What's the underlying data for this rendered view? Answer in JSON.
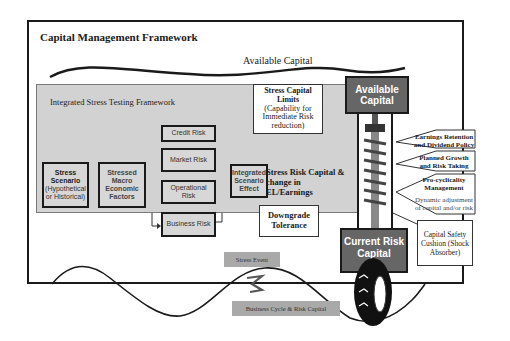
{
  "title": "Capital Management Framework",
  "available_capital_curve_label": "Available Capital",
  "stress_testing": {
    "title": "Integrated Stress Testing Framework",
    "scenario": {
      "bold": "Stress Scenario",
      "sub": "(Hypothetical or Historical)"
    },
    "macro": "Stressed Macro Economic Factors",
    "risks": [
      "Credit Risk",
      "Market Risk",
      "Operational Risk",
      "Business Risk"
    ],
    "integrated": "Integrated Scenario Effect",
    "limits": {
      "bold": "Stress Capital Limits",
      "sub": "(Capability for Immediate Risk reduction)"
    },
    "stress_risk": "Stress Risk Capital & change in EL/Earnings",
    "downgrade": "Downgrade Tolerance"
  },
  "strut": {
    "top": "Available Capital",
    "bottom": "Current Risk Capital"
  },
  "levers": [
    {
      "bold": "Earnings Retention and Dividend Policy",
      "sub": ""
    },
    {
      "bold": "Planned Growth and Risk Taking",
      "sub": ""
    },
    {
      "bold": "Pro-cyclicality Management",
      "sub": "Dynamic adjustment of capital and/or risk"
    }
  ],
  "cushion": "Capital Safety Cushion (Shock Absorber)",
  "stress_event": "Stress Event",
  "business_cycle": "Business Cycle & Risk Capital",
  "colors": {
    "panel": "#d2d2d2",
    "dark_box": "#666666",
    "tag": "#a9a9a9",
    "line": "#1a1a1a"
  }
}
